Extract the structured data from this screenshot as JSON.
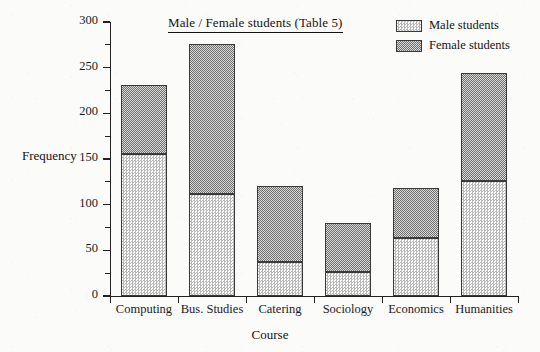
{
  "chart_data": {
    "type": "bar",
    "subtype": "stacked",
    "title": "Male / Female students (Table 5)",
    "xlabel": "Course",
    "ylabel": "Frequency",
    "categories": [
      "Computing",
      "Bus. Studies",
      "Catering",
      "Sociology",
      "Economics",
      "Humanities"
    ],
    "series": [
      {
        "name": "Male students",
        "values": [
          156,
          112,
          37,
          26,
          63,
          126
        ]
      },
      {
        "name": "Female students",
        "values": [
          75,
          164,
          83,
          54,
          55,
          118
        ]
      }
    ],
    "totals": [
      231,
      276,
      120,
      80,
      118,
      244
    ],
    "ylim": [
      0,
      300
    ],
    "ytick_labels": [
      "0",
      "50",
      "100",
      "150",
      "200",
      "250",
      "300"
    ],
    "ytick_values": [
      0,
      50,
      100,
      150,
      200,
      250,
      300
    ],
    "yminor_tick_values": [
      25,
      75,
      125,
      175,
      225,
      275
    ],
    "grid": false,
    "legend_position": "top-right",
    "legend": [
      {
        "label": "Male students",
        "swatch": "light-dither"
      },
      {
        "label": "Female students",
        "swatch": "dark-dither"
      }
    ],
    "colors": {
      "male_fill": "#b9b9b9",
      "female_fill": "#6f6f6f",
      "outline": "#3a3a3a",
      "axis": "#222222",
      "text": "#141414",
      "background": "#fbfbfa"
    }
  }
}
